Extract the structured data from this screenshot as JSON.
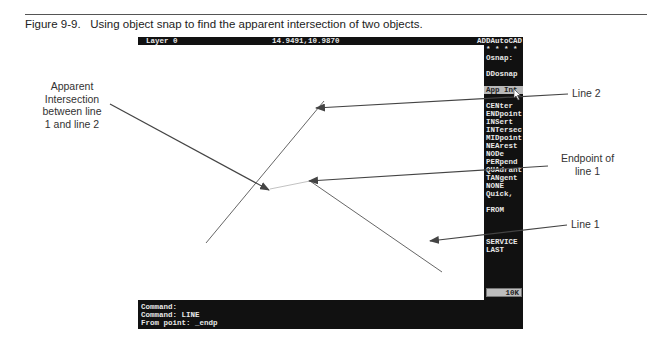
{
  "figure": {
    "caption": "Figure 9-9.   Using object snap to find the apparent intersection of two objects."
  },
  "autocad": {
    "status_bar": {
      "layer": "Layer 0",
      "coordinates": "14.9491,10.9870",
      "menu_title": "ADDAutoCAD"
    },
    "side_menu": {
      "items": [
        {
          "label": "* * * *"
        },
        {
          "label": "Osnap:"
        },
        {
          "label": "DDosnap"
        },
        {
          "label": "App Int",
          "highlighted": true
        },
        {
          "label": "CENter"
        },
        {
          "label": "ENDpoint"
        },
        {
          "label": "INSert"
        },
        {
          "label": "INTersec"
        },
        {
          "label": "MIDpoint"
        },
        {
          "label": "NEArest"
        },
        {
          "label": "NODe"
        },
        {
          "label": "PERpend"
        },
        {
          "label": "QUAdrant"
        },
        {
          "label": "TANgent"
        },
        {
          "label": "NONE"
        },
        {
          "label": "Quick,"
        },
        {
          "label": "FROM"
        },
        {
          "label": "SERVICE"
        },
        {
          "label": "LAST"
        }
      ],
      "memory_indicator": "10K"
    },
    "command_area": {
      "lines": [
        "Command:",
        "Command: LINE",
        "From point: _endp"
      ]
    }
  },
  "callouts": {
    "apparent_intersection": [
      "Apparent",
      "Intersection",
      "between line",
      "1 and line 2"
    ],
    "line2": "Line 2",
    "endpoint": [
      "Endpoint of",
      "line 1"
    ],
    "line1": "Line 1"
  }
}
